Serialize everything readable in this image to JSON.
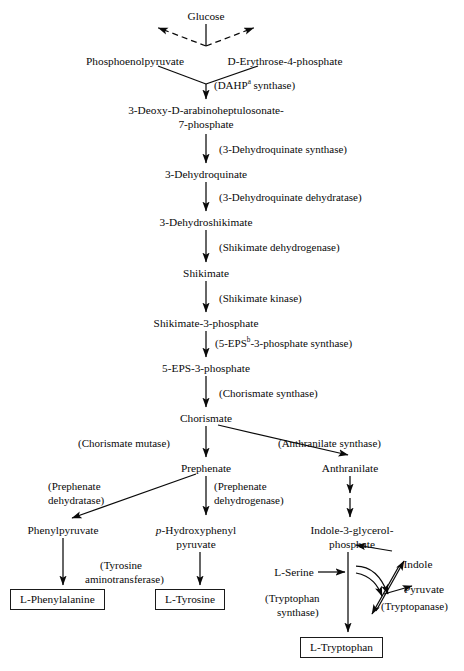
{
  "diagram": {
    "type": "biochemical-pathway-flowchart",
    "ink_color": "#0a0a0a",
    "background": "#ffffff"
  },
  "metabolites": [
    {
      "id": "glucose",
      "label": "Glucose",
      "x": 206,
      "y": 10
    },
    {
      "id": "pep",
      "label": "Phosphoenolpyruvate",
      "x": 135,
      "y": 55
    },
    {
      "id": "e4p",
      "label": "D-Erythrose-4-phosphate",
      "x": 285,
      "y": 55
    },
    {
      "id": "dahp_l1",
      "label": "3-Deoxy-D-arabinoheptulosonate-",
      "x": 206,
      "y": 104
    },
    {
      "id": "dahp_l2",
      "label": "7-phosphate",
      "x": 206,
      "y": 118
    },
    {
      "id": "dhq",
      "label": "3-Dehydroquinate",
      "x": 206,
      "y": 168
    },
    {
      "id": "dhs",
      "label": "3-Dehydroshikimate",
      "x": 206,
      "y": 216
    },
    {
      "id": "shikimate",
      "label": "Shikimate",
      "x": 206,
      "y": 267
    },
    {
      "id": "s3p",
      "label": "Shikimate-3-phosphate",
      "x": 206,
      "y": 317
    },
    {
      "id": "eps3p",
      "label": "5-EPS-3-phosphate",
      "x": 206,
      "y": 362
    },
    {
      "id": "chorismate",
      "label": "Chorismate",
      "x": 206,
      "y": 412
    },
    {
      "id": "prephenate",
      "label": "Prephenate",
      "x": 206,
      "y": 462
    },
    {
      "id": "anthranilate",
      "label": "Anthranilate",
      "x": 350,
      "y": 462
    },
    {
      "id": "phenylpyruvate",
      "label": "Phenylpyruvate",
      "x": 63,
      "y": 524
    },
    {
      "id": "hpp_l1",
      "label": "p-Hydroxyphenyl",
      "x": 196,
      "y": 524
    },
    {
      "id": "hpp_l2",
      "label": "pyruvate",
      "x": 196,
      "y": 538
    },
    {
      "id": "igp_l1",
      "label": "Indole-3-glycerol-",
      "x": 352,
      "y": 524
    },
    {
      "id": "igp_l2",
      "label": "phosphate",
      "x": 352,
      "y": 538
    },
    {
      "id": "lserine",
      "label": "L-Serine",
      "x": 294,
      "y": 574
    },
    {
      "id": "indole",
      "label": "Indole",
      "x": 418,
      "y": 565
    },
    {
      "id": "pyruvate",
      "label": "Pyruvate",
      "x": 424,
      "y": 591
    }
  ],
  "boxed_products": [
    {
      "id": "phenylalanine",
      "label": "L-Phenylalanine",
      "x": 10,
      "y": 589
    },
    {
      "id": "tyrosine",
      "label": "L-Tyrosine",
      "x": 155,
      "y": 589
    },
    {
      "id": "tryptophan",
      "label": "L-Tryptophan",
      "x": 300,
      "y": 637
    }
  ],
  "enzymes": [
    {
      "id": "dahp-synthase",
      "label": "(DAHP",
      "sup": "a",
      "tail": " synthase)",
      "x": 214,
      "y": 79
    },
    {
      "id": "dhq-synthase",
      "label": "(3-Dehydroquinate synthase)",
      "x": 219,
      "y": 143
    },
    {
      "id": "dhq-dehydratase",
      "label": "(3-Dehydroquinate dehydratase)",
      "x": 219,
      "y": 191
    },
    {
      "id": "shikimate-dehydrogenase",
      "label": "(Shikimate dehydrogenase)",
      "x": 219,
      "y": 241
    },
    {
      "id": "shikimate-kinase",
      "label": "(Shikimate kinase)",
      "x": 219,
      "y": 292
    },
    {
      "id": "eps3p-synthase",
      "label": "(5-EPS",
      "sup": "b",
      "tail": "-3-phosphate synthase)",
      "x": 215,
      "y": 337
    },
    {
      "id": "chorismate-synthase",
      "label": "(Chorismate synthase)",
      "x": 219,
      "y": 387
    },
    {
      "id": "chorismate-mutase",
      "label": "(Chorismate mutase)",
      "x": 78,
      "y": 437
    },
    {
      "id": "anthranilate-synthase",
      "label": "(Anthranilate synthase)",
      "x": 278,
      "y": 437
    },
    {
      "id": "prephenate-dehydratase-1",
      "label": "(Prephenate",
      "x": 48,
      "y": 480
    },
    {
      "id": "prephenate-dehydratase-2",
      "label": "dehydratase)",
      "x": 48,
      "y": 494
    },
    {
      "id": "prephenate-dehydrogenase-1",
      "label": "(Prephenate",
      "x": 214,
      "y": 480
    },
    {
      "id": "prephenate-dehydrogenase-2",
      "label": "dehydrogenase)",
      "x": 214,
      "y": 494
    },
    {
      "id": "tyrosine-aminotransferase-1",
      "label": "(Tyrosine",
      "x": 100,
      "y": 559
    },
    {
      "id": "tyrosine-aminotransferase-2",
      "label": "aminotransferase)",
      "x": 85,
      "y": 573
    },
    {
      "id": "tryptophan-synthase-1",
      "label": "(Tryptophan",
      "x": 265,
      "y": 592
    },
    {
      "id": "tryptophan-synthase-2",
      "label": "synthase)",
      "x": 277,
      "y": 606
    },
    {
      "id": "tryptopanase",
      "label": "(Tryptopanase)",
      "x": 381,
      "y": 607
    }
  ],
  "footnotes": [
    {
      "marker": "a",
      "expands": "DAHP"
    },
    {
      "marker": "b",
      "expands": "5-EPS"
    }
  ]
}
